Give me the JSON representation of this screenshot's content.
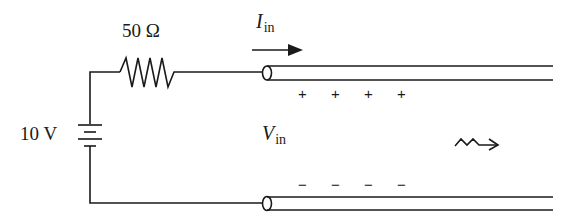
{
  "diagram": {
    "resistor": {
      "label": "50 Ω"
    },
    "source": {
      "label": "10 V"
    },
    "current": {
      "symbol": "I",
      "subscript": "in"
    },
    "voltage": {
      "symbol": "V",
      "subscript": "in"
    },
    "top_charges": [
      "+",
      "+",
      "+",
      "+"
    ],
    "bottom_charges": [
      "−",
      "−",
      "−",
      "−"
    ],
    "propagation_icon": "wave-arrow",
    "stroke_color": "#1a1a1a"
  }
}
